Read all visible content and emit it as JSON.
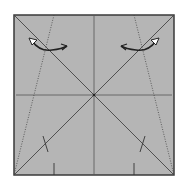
{
  "diagram": {
    "type": "origami-crease-pattern",
    "paper_color": "#b4b4b4",
    "border_color": "#3a3a3a",
    "line_color": "#555555",
    "elements": {
      "square": {
        "x": 13,
        "y": 14,
        "size": 162
      },
      "valley_folds": [
        "vertical-center",
        "horizontal-center",
        "diagonal-tl-br",
        "diagonal-tr-bl"
      ],
      "mountain_folds_dotted": [
        "left-slant",
        "right-slant"
      ],
      "arrows": [
        "left-fold-arrow",
        "right-fold-arrow"
      ],
      "tick_marks": [
        "left-diagonal-tick",
        "right-diagonal-tick",
        "bottom-left-tick",
        "bottom-right-tick"
      ]
    }
  }
}
